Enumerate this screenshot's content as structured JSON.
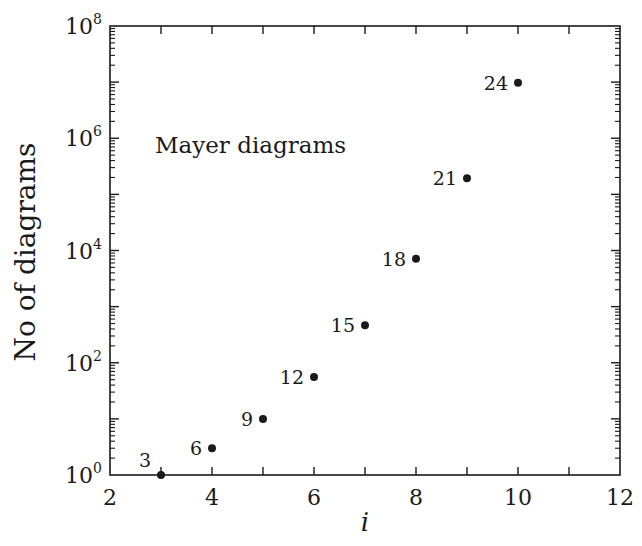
{
  "chart_data": {
    "type": "scatter",
    "title": "",
    "xlabel": "i",
    "ylabel": "No of diagrams",
    "yscale": "log",
    "xlim": [
      2,
      12
    ],
    "ylim": [
      1,
      100000000
    ],
    "x_ticks": [
      2,
      4,
      6,
      8,
      10,
      12
    ],
    "x_tick_labels": [
      "2",
      "4",
      "6",
      "8",
      "10",
      "12"
    ],
    "y_ticks": [
      1,
      100,
      10000,
      1000000,
      100000000
    ],
    "y_tick_labels": [
      {
        "base": "10",
        "exp": "0"
      },
      {
        "base": "10",
        "exp": "2"
      },
      {
        "base": "10",
        "exp": "4"
      },
      {
        "base": "10",
        "exp": "6"
      },
      {
        "base": "10",
        "exp": "8"
      }
    ],
    "grid": false,
    "annotation": "Mayer diagrams",
    "series": [
      {
        "name": "Mayer diagrams",
        "x": [
          3,
          4,
          5,
          6,
          7,
          8,
          9,
          10
        ],
        "values": [
          1,
          3,
          10,
          56,
          468,
          7123,
          194066,
          9743542
        ],
        "point_labels": [
          "3",
          "6",
          "9",
          "12",
          "15",
          "18",
          "21",
          "24"
        ]
      }
    ],
    "colors": {
      "ink": "#1a1a1a",
      "background": "#ffffff"
    }
  }
}
